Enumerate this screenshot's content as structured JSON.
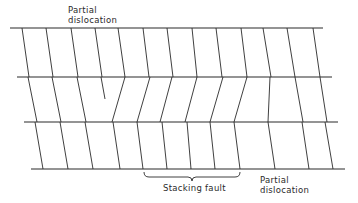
{
  "diagram": {
    "type": "crystal-lattice-schematic",
    "colors": {
      "line": "#2a2a2a",
      "background": "#ffffff"
    },
    "labels": {
      "partial_top_line1": "Partial",
      "partial_top_line2": "dislocation",
      "stacking_fault": "Stacking fault",
      "partial_bottom_line1": "Partial",
      "partial_bottom_line2": "dislocation"
    },
    "horizontal_planes": [
      {
        "y": 28,
        "x1": 10,
        "x2": 323
      },
      {
        "y": 77,
        "x1": 17,
        "x2": 332
      },
      {
        "y": 122,
        "x1": 24,
        "x2": 338
      },
      {
        "y": 169,
        "x1": 31,
        "x2": 345
      }
    ],
    "row_segments": [
      {
        "y_top": 28,
        "y_bottom": 77,
        "segments": [
          [
            22,
            29
          ],
          [
            46,
            53
          ],
          [
            71,
            78
          ],
          [
            95,
            102
          ],
          [
            118,
            125
          ],
          [
            143,
            149
          ],
          [
            167,
            173
          ],
          [
            192,
            197
          ],
          [
            216,
            222
          ],
          [
            241,
            247
          ],
          [
            263,
            271
          ],
          [
            287,
            295
          ],
          [
            313,
            320
          ]
        ]
      },
      {
        "y_top": 77,
        "y_bottom": 122,
        "segments": [
          [
            28,
            37
          ],
          [
            52,
            61
          ],
          [
            77,
            86
          ],
          [
            125,
            112
          ],
          [
            150,
            137
          ],
          [
            172,
            160
          ],
          [
            197,
            185
          ],
          [
            223,
            210
          ],
          [
            247,
            234
          ],
          [
            270,
            268
          ],
          [
            295,
            303
          ],
          [
            320,
            327
          ]
        ],
        "terminating_half_plane": {
          "x_top": 101,
          "y_top": 77,
          "x_end": 105,
          "y_end": 99
        }
      },
      {
        "y_top": 122,
        "y_bottom": 169,
        "segments": [
          [
            35,
            43
          ],
          [
            60,
            68
          ],
          [
            85,
            93
          ],
          [
            113,
            120
          ],
          [
            137,
            143
          ],
          [
            162,
            167
          ],
          [
            187,
            191
          ],
          [
            210,
            215
          ],
          [
            234,
            240
          ],
          [
            268,
            275
          ],
          [
            302,
            309
          ],
          [
            325,
            333
          ]
        ]
      }
    ],
    "bracket": {
      "x1": 144,
      "x2": 240,
      "y": 172,
      "depth": 5
    }
  }
}
